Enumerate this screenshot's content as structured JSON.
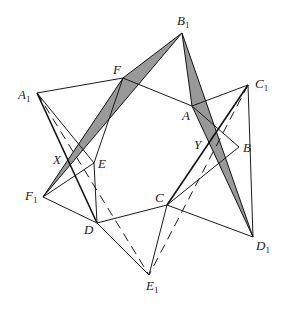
{
  "figure": {
    "type": "geometry-diagram",
    "colors": {
      "line": "#1a1a1a",
      "shade": "#999999",
      "background": "#ffffff"
    },
    "points": {
      "A1": {
        "label": "A",
        "sub": "1",
        "x": 37,
        "y": 93
      },
      "B1": {
        "label": "B",
        "sub": "1",
        "x": 182,
        "y": 33
      },
      "C1": {
        "label": "C",
        "sub": "1",
        "x": 248,
        "y": 85
      },
      "D1": {
        "label": "D",
        "sub": "1",
        "x": 253,
        "y": 237
      },
      "E1": {
        "label": "E",
        "sub": "1",
        "x": 149,
        "y": 275
      },
      "F1": {
        "label": "F",
        "sub": "1",
        "x": 43,
        "y": 197
      },
      "A": {
        "label": "A",
        "x": 192,
        "y": 106
      },
      "B": {
        "label": "B",
        "x": 239,
        "y": 147
      },
      "C": {
        "label": "C",
        "x": 167,
        "y": 205
      },
      "D": {
        "label": "D",
        "x": 97,
        "y": 223
      },
      "E": {
        "label": "E",
        "x": 94,
        "y": 163
      },
      "F": {
        "label": "F",
        "x": 123,
        "y": 78
      },
      "X": {
        "label": "X",
        "x": 68,
        "y": 163
      },
      "Y": {
        "label": "Y",
        "x": 205,
        "y": 143
      }
    },
    "labels": {
      "A1": {
        "text": "A",
        "sub": "1"
      },
      "B1": {
        "text": "B",
        "sub": "1"
      },
      "C1": {
        "text": "C",
        "sub": "1"
      },
      "D1": {
        "text": "D",
        "sub": "1"
      },
      "E1": {
        "text": "E",
        "sub": "1"
      },
      "F1": {
        "text": "F",
        "sub": "1"
      },
      "A": {
        "text": "A"
      },
      "B": {
        "text": "B"
      },
      "C": {
        "text": "C"
      },
      "D": {
        "text": "D"
      },
      "E": {
        "text": "E"
      },
      "F": {
        "text": "F"
      },
      "X": {
        "text": "X"
      },
      "Y": {
        "text": "Y"
      }
    },
    "shaded_triangles": [
      [
        "B1",
        "F",
        "F1"
      ],
      [
        "B1",
        "A",
        "D1"
      ]
    ],
    "solid_segments": [
      [
        "A",
        "B"
      ],
      [
        "B",
        "C"
      ],
      [
        "C",
        "D"
      ],
      [
        "D",
        "E"
      ],
      [
        "E",
        "F"
      ],
      [
        "F",
        "A"
      ],
      [
        "A1",
        "F"
      ],
      [
        "A1",
        "D"
      ],
      [
        "A1",
        "E"
      ],
      [
        "C1",
        "A"
      ],
      [
        "C1",
        "C"
      ],
      [
        "C1",
        "D1"
      ],
      [
        "D1",
        "C"
      ],
      [
        "E1",
        "D"
      ],
      [
        "E1",
        "C"
      ],
      [
        "F1",
        "E"
      ],
      [
        "F1",
        "D"
      ]
    ],
    "dashed_segments": [
      [
        "A1",
        "E1"
      ],
      [
        "C1",
        "E1"
      ]
    ]
  }
}
